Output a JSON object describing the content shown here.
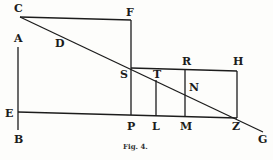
{
  "figure": {
    "caption": "Fig. 4.",
    "labels": {
      "C": "C",
      "F": "F",
      "A": "A",
      "D": "D",
      "S": "S",
      "T": "T",
      "R": "R",
      "H": "H",
      "N": "N",
      "E": "E",
      "B": "B",
      "P": "P",
      "L": "L",
      "M": "M",
      "Z": "Z",
      "G": "G"
    },
    "points": {
      "C": [
        20,
        17
      ],
      "F": [
        131,
        20
      ],
      "S": [
        131,
        68
      ],
      "R": [
        185,
        70
      ],
      "H": [
        237,
        71
      ],
      "Z": [
        237,
        118
      ],
      "G": [
        263,
        132
      ],
      "E": [
        18,
        112
      ],
      "P": [
        131,
        115
      ],
      "L": [
        156,
        116
      ],
      "M": [
        185,
        117
      ],
      "T": [
        156,
        80
      ],
      "N": [
        185,
        93
      ],
      "A_top": [
        18,
        47
      ],
      "B_bottom": [
        18,
        130
      ]
    },
    "segments": [
      [
        "C",
        "F"
      ],
      [
        "F",
        "S"
      ],
      [
        "S",
        "P"
      ],
      [
        "C",
        "G"
      ],
      [
        "S",
        "H"
      ],
      [
        "H",
        "Z"
      ],
      [
        "E",
        "Z"
      ],
      [
        "A_top",
        "B_bottom"
      ],
      [
        "T",
        "L"
      ],
      [
        "R",
        "M"
      ]
    ]
  }
}
